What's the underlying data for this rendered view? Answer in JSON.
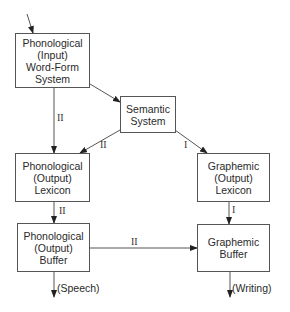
{
  "nodes": {
    "input_wordform": {
      "lines": [
        "Phonological",
        "(Input)",
        "Word-Form",
        "System"
      ]
    },
    "semantic": {
      "lines": [
        "Semantic",
        "System"
      ]
    },
    "phon_lexicon": {
      "lines": [
        "Phonological",
        "(Output)",
        "Lexicon"
      ]
    },
    "graph_lexicon": {
      "lines": [
        "Graphemic",
        "(Output)",
        "Lexicon"
      ]
    },
    "phon_buffer": {
      "lines": [
        "Phonological",
        "(Output)",
        "Buffer"
      ]
    },
    "graph_buffer": {
      "lines": [
        "Graphemic",
        "Buffer"
      ]
    }
  },
  "edge_labels": {
    "input_to_phon_lexicon": "II",
    "semantic_to_phon_lexicon": "II",
    "semantic_to_graph_lexicon": "I",
    "phon_lexicon_to_phon_buffer": "II",
    "graph_lexicon_to_graph_buffer": "I",
    "phon_buffer_to_graph_buffer": "II"
  },
  "outputs": {
    "speech": "(Speech)",
    "writing": "(Writing)"
  }
}
